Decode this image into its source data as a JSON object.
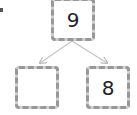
{
  "diagram": {
    "type": "number-bond",
    "top": {
      "value": "9"
    },
    "left": {
      "value": ""
    },
    "right": {
      "value": "8"
    },
    "colors": {
      "border": "#9a9a9a",
      "arrow": "#c0c0c0",
      "text": "#222222"
    }
  }
}
